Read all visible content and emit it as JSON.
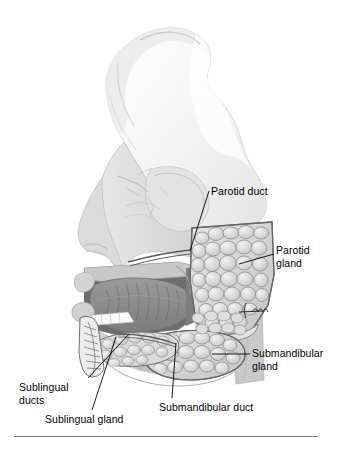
{
  "figure": {
    "background_color": "#ffffff",
    "ink_color": "#000000",
    "rule_color": "#777777",
    "palette": {
      "skull_light": "#f2f2f2",
      "skull_mid": "#dcdcdc",
      "skull_shadow": "#c3c3c3",
      "soft_tissue": "#cfcfcf",
      "gland_fill": "#d6d6d6",
      "gland_lobule": "#e9e9e9",
      "gland_outline": "#7a7a7a",
      "tongue_dark": "#8d8d8d",
      "cavity_dark": "#6f6f6f",
      "teeth_white": "#fbfbfb",
      "duct_line": "#5a5a5a"
    }
  },
  "labels": [
    {
      "id": "parotid-duct",
      "text": "Parotid duct",
      "lines": [
        "Parotid duct"
      ],
      "anchor_x": 190,
      "anchor_y": 251,
      "text_x": 211,
      "text_y": 185
    },
    {
      "id": "parotid-gland",
      "text": "Parotid gland",
      "lines": [
        "Parotid",
        "gland"
      ],
      "anchor_x": 239,
      "anchor_y": 264,
      "text_x": 276,
      "text_y": 244
    },
    {
      "id": "submandibular-gland",
      "text": "Submandibular gland",
      "lines": [
        "Submandibular",
        "gland"
      ],
      "anchor_x": 212,
      "anchor_y": 354,
      "text_x": 252,
      "text_y": 347
    },
    {
      "id": "submandibular-duct",
      "text": "Submandibular duct",
      "lines": [
        "Submandibular duct"
      ],
      "anchor_x": 176,
      "anchor_y": 343,
      "text_x": 159,
      "text_y": 401
    },
    {
      "id": "sublingual-ducts",
      "text": "Sublingual ducts",
      "lines": [
        "Sublingual",
        "ducts"
      ],
      "anchor_x": 129,
      "anchor_y": 334,
      "text_x": 19,
      "text_y": 381
    },
    {
      "id": "sublingual-gland",
      "text": "Sublingual gland",
      "lines": [
        "Sublingual gland"
      ],
      "anchor_x": 116,
      "anchor_y": 337,
      "text_x": 45,
      "text_y": 413
    }
  ],
  "annotations": {
    "unlabeled_mark": "squiggle-mark"
  },
  "bottom_rule": {
    "x": 14,
    "y": 436,
    "width": 304
  }
}
